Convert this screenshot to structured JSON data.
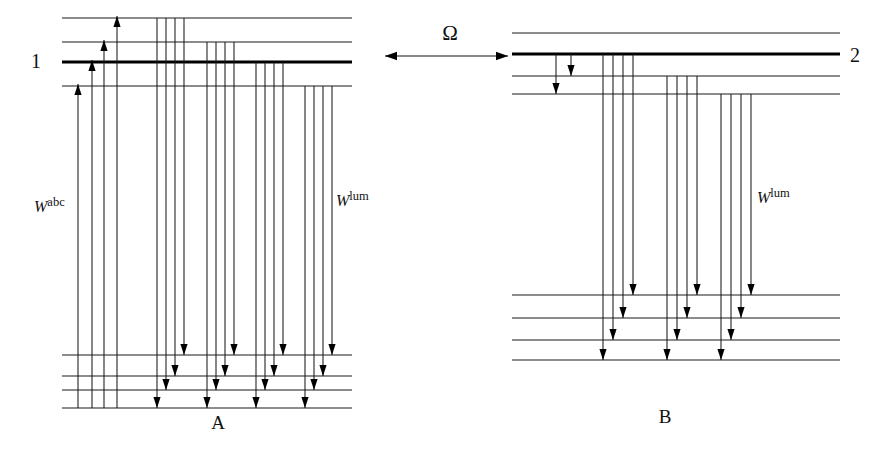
{
  "figure": {
    "background_color": "#ffffff",
    "line_color": "#1a1a1a",
    "thick_line_color": "#000000",
    "width": 890,
    "height": 449
  },
  "labels": {
    "site1": "1",
    "site2": "2",
    "panelA": "A",
    "panelB": "B",
    "omega": "Ω",
    "rate_abs_base": "W",
    "rate_abs_sup": "abc",
    "rate_lum_base": "W",
    "rate_lum_sup": "lum"
  },
  "left_panel": {
    "name": "A",
    "upper_manifold": {
      "levels": [
        {
          "id": "A-u1",
          "y": 18,
          "x1": 62,
          "x2": 352,
          "weight": "thin"
        },
        {
          "id": "A-u2",
          "y": 42,
          "x1": 62,
          "x2": 352,
          "weight": "thin"
        },
        {
          "id": "A-u3",
          "y": 62,
          "x1": 62,
          "x2": 352,
          "weight": "thick"
        },
        {
          "id": "A-u4",
          "y": 86,
          "x1": 62,
          "x2": 352,
          "weight": "thin"
        }
      ]
    },
    "lower_manifold": {
      "levels": [
        {
          "id": "A-l1",
          "y": 355,
          "x1": 62,
          "x2": 352,
          "weight": "thin"
        },
        {
          "id": "A-l2",
          "y": 376,
          "x1": 62,
          "x2": 352,
          "weight": "thin"
        },
        {
          "id": "A-l3",
          "y": 390,
          "x1": 62,
          "x2": 352,
          "weight": "thin"
        },
        {
          "id": "A-l4",
          "y": 408,
          "x1": 62,
          "x2": 352,
          "weight": "thin"
        }
      ]
    },
    "absorption_arrows": [
      {
        "x": 78,
        "y_start": 408,
        "y_end": 84,
        "head": "up"
      },
      {
        "x": 92,
        "y_start": 408,
        "y_end": 60,
        "head": "up"
      },
      {
        "x": 104,
        "y_start": 408,
        "y_end": 40,
        "head": "up"
      },
      {
        "x": 117,
        "y_start": 408,
        "y_end": 16,
        "head": "up"
      }
    ],
    "luminescence_arrows": [
      {
        "x": 157,
        "y_start": 18,
        "y_end": 408,
        "head": "down"
      },
      {
        "x": 166,
        "y_start": 18,
        "y_end": 390,
        "head": "down"
      },
      {
        "x": 175,
        "y_start": 18,
        "y_end": 376,
        "head": "down"
      },
      {
        "x": 184,
        "y_start": 18,
        "y_end": 355,
        "head": "down"
      },
      {
        "x": 207,
        "y_start": 42,
        "y_end": 408,
        "head": "down"
      },
      {
        "x": 216,
        "y_start": 42,
        "y_end": 390,
        "head": "down"
      },
      {
        "x": 225,
        "y_start": 42,
        "y_end": 376,
        "head": "down"
      },
      {
        "x": 234,
        "y_start": 42,
        "y_end": 355,
        "head": "down"
      },
      {
        "x": 256,
        "y_start": 62,
        "y_end": 408,
        "head": "down"
      },
      {
        "x": 265,
        "y_start": 62,
        "y_end": 390,
        "head": "down"
      },
      {
        "x": 274,
        "y_start": 62,
        "y_end": 376,
        "head": "down"
      },
      {
        "x": 283,
        "y_start": 62,
        "y_end": 355,
        "head": "down"
      },
      {
        "x": 305,
        "y_start": 86,
        "y_end": 408,
        "head": "down"
      },
      {
        "x": 314,
        "y_start": 86,
        "y_end": 390,
        "head": "down"
      },
      {
        "x": 323,
        "y_start": 86,
        "y_end": 376,
        "head": "down"
      },
      {
        "x": 332,
        "y_start": 86,
        "y_end": 355,
        "head": "down"
      }
    ],
    "label_positions": {
      "site_number": {
        "x": 36,
        "y": 68
      },
      "panel": {
        "x": 218,
        "y": 429
      },
      "rate_abs": {
        "x": 34,
        "y": 212
      },
      "rate_lum": {
        "x": 336,
        "y": 206
      }
    }
  },
  "right_panel": {
    "name": "B",
    "upper_manifold": {
      "levels": [
        {
          "id": "B-u1",
          "y": 33,
          "x1": 512,
          "x2": 840,
          "weight": "thin"
        },
        {
          "id": "B-u2",
          "y": 54,
          "x1": 512,
          "x2": 840,
          "weight": "thick"
        },
        {
          "id": "B-u3",
          "y": 76,
          "x1": 512,
          "x2": 840,
          "weight": "thin"
        },
        {
          "id": "B-u4",
          "y": 94,
          "x1": 512,
          "x2": 840,
          "weight": "thin"
        }
      ]
    },
    "lower_manifold": {
      "levels": [
        {
          "id": "B-l1",
          "y": 295,
          "x1": 512,
          "x2": 840,
          "weight": "thin"
        },
        {
          "id": "B-l2",
          "y": 318,
          "x1": 512,
          "x2": 840,
          "weight": "thin"
        },
        {
          "id": "B-l3",
          "y": 340,
          "x1": 512,
          "x2": 840,
          "weight": "thin"
        },
        {
          "id": "B-l4",
          "y": 360,
          "x1": 512,
          "x2": 840,
          "weight": "thin"
        }
      ]
    },
    "relaxation_arrows": [
      {
        "x": 571,
        "y_start": 54,
        "y_end": 76,
        "head": "down"
      },
      {
        "x": 556,
        "y_start": 54,
        "y_end": 94,
        "head": "down"
      }
    ],
    "luminescence_arrows": [
      {
        "x": 603,
        "y_start": 54,
        "y_end": 360,
        "head": "down"
      },
      {
        "x": 613,
        "y_start": 54,
        "y_end": 340,
        "head": "down"
      },
      {
        "x": 623,
        "y_start": 54,
        "y_end": 318,
        "head": "down"
      },
      {
        "x": 633,
        "y_start": 54,
        "y_end": 295,
        "head": "down"
      },
      {
        "x": 667,
        "y_start": 76,
        "y_end": 360,
        "head": "down"
      },
      {
        "x": 677,
        "y_start": 76,
        "y_end": 340,
        "head": "down"
      },
      {
        "x": 687,
        "y_start": 76,
        "y_end": 318,
        "head": "down"
      },
      {
        "x": 697,
        "y_start": 76,
        "y_end": 295,
        "head": "down"
      },
      {
        "x": 721,
        "y_start": 94,
        "y_end": 360,
        "head": "down"
      },
      {
        "x": 731,
        "y_start": 94,
        "y_end": 340,
        "head": "down"
      },
      {
        "x": 741,
        "y_start": 94,
        "y_end": 318,
        "head": "down"
      },
      {
        "x": 751,
        "y_start": 94,
        "y_end": 295,
        "head": "down"
      }
    ],
    "label_positions": {
      "site_number": {
        "x": 855,
        "y": 62
      },
      "panel": {
        "x": 665,
        "y": 423
      },
      "rate_lum": {
        "x": 757,
        "y": 203
      }
    }
  },
  "coupling": {
    "symbol": "Ω",
    "symbol_x": 450,
    "symbol_y": 40,
    "arrow_y": 56,
    "arrow_x1": 385,
    "arrow_x2": 508,
    "double_headed": true
  }
}
